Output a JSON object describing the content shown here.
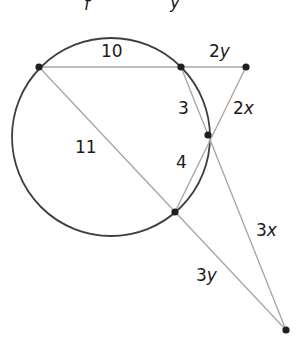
{
  "diagram": {
    "type": "geometry-secants-tangents",
    "colors": {
      "circle": "#3f3f3f",
      "segments": "#a8a8a8",
      "points": "#1f1f1f",
      "labels": "#1a1a1a",
      "background": "#ffffff"
    },
    "circle": {
      "cx": 111,
      "cy": 137,
      "r": 99
    },
    "points": [
      {
        "id": "A",
        "x": 39,
        "y": 67
      },
      {
        "id": "B",
        "x": 181,
        "y": 67
      },
      {
        "id": "C",
        "x": 246,
        "y": 67
      },
      {
        "id": "D",
        "x": 208,
        "y": 135
      },
      {
        "id": "E",
        "x": 175,
        "y": 212
      },
      {
        "id": "F",
        "x": 286,
        "y": 330
      }
    ],
    "segments": [
      {
        "from": "A",
        "to": "C"
      },
      {
        "from": "A",
        "to": "F"
      },
      {
        "from": "B",
        "to": "F"
      },
      {
        "from": "C",
        "to": "E"
      }
    ],
    "labels": {
      "top_fragment_1": "f",
      "top_fragment_2": "y",
      "ab": "10",
      "bc": "2y",
      "bd": "3",
      "cd_text": "2",
      "cd_var": "x",
      "ae": "11",
      "de": "4",
      "df_text": "3",
      "df_var": "x",
      "ef_text": "3",
      "ef_var": "y",
      "bc_text": "2",
      "bc_var": "y"
    }
  }
}
